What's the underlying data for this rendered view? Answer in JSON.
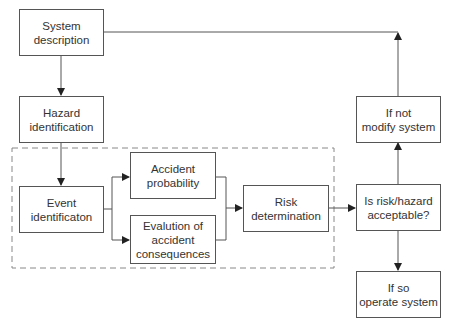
{
  "diagram": {
    "type": "flowchart",
    "nodes": [
      {
        "id": "system_description",
        "label": "System\ndescription"
      },
      {
        "id": "hazard_identification",
        "label": "Hazard\nidentification"
      },
      {
        "id": "event_identification",
        "label": "Event\nidentificaton"
      },
      {
        "id": "accident_probability",
        "label": "Accident\nprobability"
      },
      {
        "id": "evaluation_consequences",
        "label": "Evalution of\naccident\nconsequences"
      },
      {
        "id": "risk_determination",
        "label": "Risk\ndetermination"
      },
      {
        "id": "is_acceptable",
        "label": "Is risk/hazard\nacceptable?"
      },
      {
        "id": "if_not",
        "label": "If not\nmodify system"
      },
      {
        "id": "if_so",
        "label": "If so\noperate system"
      }
    ],
    "edges": [
      {
        "from": "system_description",
        "to": "hazard_identification"
      },
      {
        "from": "hazard_identification",
        "to": "event_identification"
      },
      {
        "from": "event_identification",
        "to": "accident_probability"
      },
      {
        "from": "event_identification",
        "to": "evaluation_consequences"
      },
      {
        "from": "accident_probability",
        "to": "risk_determination"
      },
      {
        "from": "evaluation_consequences",
        "to": "risk_determination"
      },
      {
        "from": "risk_determination",
        "to": "is_acceptable"
      },
      {
        "from": "is_acceptable",
        "to": "if_not"
      },
      {
        "from": "is_acceptable",
        "to": "if_so"
      },
      {
        "from": "if_not",
        "to": "system_description"
      }
    ],
    "group": {
      "style": "dashed",
      "contains": [
        "event_identification",
        "accident_probability",
        "evaluation_consequences",
        "risk_determination"
      ]
    },
    "colors": {
      "line": "#555555",
      "text": "#333333",
      "dash": "#888888"
    }
  }
}
